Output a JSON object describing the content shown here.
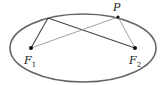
{
  "diagram": {
    "type": "ellipse-foci",
    "ellipse": {
      "cx": 83,
      "cy": 48,
      "rx": 73,
      "ry": 34,
      "stroke": "#666666"
    },
    "points": {
      "F1": {
        "x": 31,
        "y": 48,
        "label": "F",
        "subscript": "1"
      },
      "F2": {
        "x": 135,
        "y": 48,
        "label": "F",
        "subscript": "2"
      },
      "P": {
        "x": 118,
        "y": 17,
        "label": "P"
      },
      "Q": {
        "x": 48,
        "y": 18
      }
    },
    "segments": [
      {
        "from": "F1",
        "to": "Q",
        "stroke": "#444444"
      },
      {
        "from": "Q",
        "to": "F2",
        "stroke": "#444444"
      },
      {
        "from": "F1",
        "to": "P",
        "stroke": "#999999"
      },
      {
        "from": "P",
        "to": "F2",
        "stroke": "#999999"
      }
    ]
  }
}
